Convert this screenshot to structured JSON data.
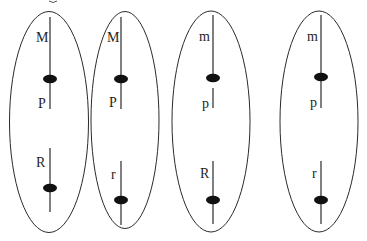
{
  "diagram": {
    "type": "meiosis-gametes-chromosomes",
    "colors": {
      "background": "#ffffff",
      "stroke": "#2a2a2a",
      "centromere": "#111111",
      "label": "#1e1e1e"
    },
    "cells": [
      {
        "id": "cell-1",
        "chromosome_1": {
          "upper_allele": "M",
          "lower_allele": "P"
        },
        "chromosome_2": {
          "allele": "R"
        }
      },
      {
        "id": "cell-2",
        "chromosome_1": {
          "upper_allele": "M",
          "lower_allele": "P"
        },
        "chromosome_2": {
          "allele": "r"
        }
      },
      {
        "id": "cell-3",
        "chromosome_1": {
          "upper_allele": "m",
          "lower_allele": "p"
        },
        "chromosome_2": {
          "allele": "R"
        }
      },
      {
        "id": "cell-4",
        "chromosome_1": {
          "upper_allele": "m",
          "lower_allele": "p"
        },
        "chromosome_2": {
          "allele": "r"
        }
      }
    ]
  }
}
